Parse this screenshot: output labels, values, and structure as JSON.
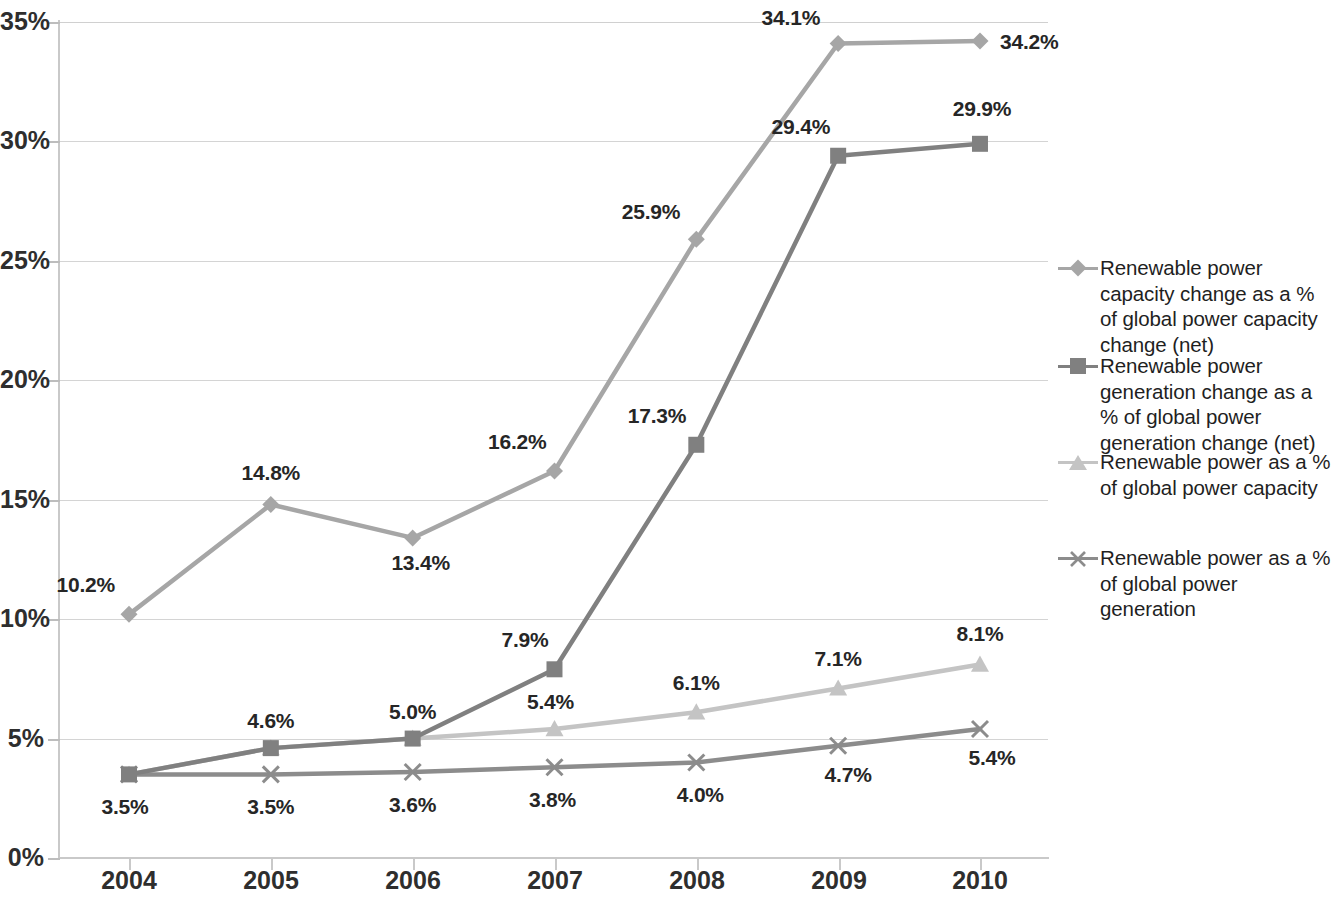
{
  "chart_data": {
    "type": "line",
    "title": "",
    "subtitle": "",
    "xlabel": "",
    "ylabel": "",
    "categories": [
      "2004",
      "2005",
      "2006",
      "2007",
      "2008",
      "2009",
      "2010"
    ],
    "ylim": [
      0,
      35
    ],
    "ytick_values": [
      0,
      5,
      10,
      15,
      20,
      25,
      30,
      35
    ],
    "ytick_labels": [
      "0%",
      "5%",
      "10%",
      "15%",
      "20%",
      "25%",
      "30%",
      "35%"
    ],
    "grid": true,
    "legend_position": "right",
    "series": [
      {
        "name": "Renewable power capacity change as a % of global power capacity change (net)",
        "marker": "diamond",
        "color": "#A6A6A6",
        "values": [
          10.2,
          14.8,
          13.4,
          16.2,
          25.9,
          34.1,
          34.2
        ],
        "labels": [
          "10.2%",
          "14.8%",
          "13.4%",
          "16.2%",
          "25.9%",
          "34.1%",
          "34.2%"
        ]
      },
      {
        "name": "Renewable power generation change as a % of global power generation change (net)",
        "marker": "square",
        "color": "#808080",
        "values": [
          3.5,
          4.6,
          5.0,
          7.9,
          17.3,
          29.4,
          29.9
        ],
        "labels": [
          "3.5%",
          "4.6%",
          "5.0%",
          "7.9%",
          "17.3%",
          "29.4%",
          "29.9%"
        ]
      },
      {
        "name": "Renewable power as a % of global power capacity",
        "marker": "triangle",
        "color": "#C4C4C4",
        "values": [
          3.5,
          4.6,
          5.0,
          5.4,
          6.1,
          7.1,
          8.1
        ],
        "labels": [
          "",
          "",
          "",
          "5.4%",
          "6.1%",
          "7.1%",
          "8.1%"
        ]
      },
      {
        "name": "Renewable power as a % of global power generation",
        "marker": "cross",
        "color": "#8C8C8C",
        "values": [
          3.5,
          3.5,
          3.6,
          3.8,
          4.0,
          4.7,
          5.4
        ],
        "labels": [
          "3.5%",
          "3.5%",
          "3.6%",
          "3.8%",
          "4.0%",
          "4.7%",
          "5.4%"
        ]
      }
    ],
    "annotations": [
      {
        "text": "10.2%",
        "x": "2004",
        "series": 0
      },
      {
        "text": "14.8%",
        "x": "2005",
        "series": 0
      },
      {
        "text": "13.4%",
        "x": "2006",
        "series": 0
      },
      {
        "text": "16.2%",
        "x": "2007",
        "series": 0
      },
      {
        "text": "25.9%",
        "x": "2008",
        "series": 0
      },
      {
        "text": "34.1%",
        "x": "2009",
        "series": 0
      },
      {
        "text": "34.2%",
        "x": "2010",
        "series": 0
      },
      {
        "text": "4.6%",
        "x": "2005",
        "series": 1
      },
      {
        "text": "5.0%",
        "x": "2006",
        "series": 1
      },
      {
        "text": "7.9%",
        "x": "2007",
        "series": 1
      },
      {
        "text": "17.3%",
        "x": "2008",
        "series": 1
      },
      {
        "text": "29.4%",
        "x": "2009",
        "series": 1
      },
      {
        "text": "29.9%",
        "x": "2010",
        "series": 1
      },
      {
        "text": "5.4%",
        "x": "2007",
        "series": 2
      },
      {
        "text": "6.1%",
        "x": "2008",
        "series": 2
      },
      {
        "text": "7.1%",
        "x": "2009",
        "series": 2
      },
      {
        "text": "8.1%",
        "x": "2010",
        "series": 2
      },
      {
        "text": "3.5%",
        "x": "2004",
        "series": 3
      },
      {
        "text": "3.5%",
        "x": "2005",
        "series": 3
      },
      {
        "text": "3.6%",
        "x": "2006",
        "series": 3
      },
      {
        "text": "3.8%",
        "x": "2007",
        "series": 3
      },
      {
        "text": "4.0%",
        "x": "2008",
        "series": 3
      },
      {
        "text": "4.7%",
        "x": "2009",
        "series": 3
      },
      {
        "text": "5.4%",
        "x": "2010",
        "series": 3
      }
    ]
  },
  "axes": {
    "y_labels": [
      "35%",
      "30%",
      "25%",
      "20%",
      "15%",
      "10%",
      "5%",
      "0%"
    ],
    "x_labels": [
      "2004",
      "2005",
      "2006",
      "2007",
      "2008",
      "2009",
      "2010"
    ]
  },
  "legend": {
    "items": [
      {
        "label": "Renewable power capacity change as a % of global power capacity change (net)",
        "marker": "diamond-marker-icon",
        "color": "#A6A6A6"
      },
      {
        "label": "Renewable power generation change as a % of global power generation change (net)",
        "marker": "square-marker-icon",
        "color": "#808080"
      },
      {
        "label": "Renewable power as a % of global power capacity",
        "marker": "triangle-marker-icon",
        "color": "#C4C4C4"
      },
      {
        "label": "Renewable power as a % of global power generation",
        "marker": "cross-marker-icon",
        "color": "#8C8C8C"
      }
    ]
  },
  "colors": {
    "gridline": "#d4d4d4",
    "axis": "#c9c9c9",
    "text": "#262626",
    "background": "#ffffff"
  }
}
